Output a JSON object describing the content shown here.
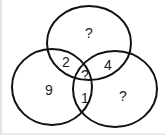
{
  "diagram": {
    "type": "venn",
    "circles": [
      {
        "name": "top",
        "cx": 89,
        "cy": 43,
        "rx": 42,
        "ry": 37
      },
      {
        "name": "left",
        "cx": 52,
        "cy": 87,
        "rx": 40,
        "ry": 38
      },
      {
        "name": "right",
        "cx": 115,
        "cy": 89,
        "rx": 42,
        "ry": 38
      }
    ],
    "regions": {
      "top_only": "?",
      "top_left": "2",
      "top_right": "4",
      "center": "?",
      "left_only": "9",
      "left_right": "1",
      "right_only": "?"
    },
    "stroke_color": "#111111"
  }
}
